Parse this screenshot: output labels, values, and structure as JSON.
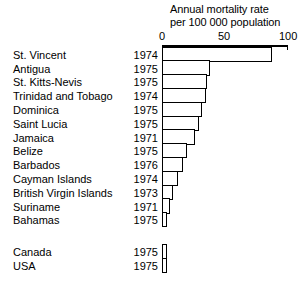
{
  "chart_data": {
    "type": "bar",
    "orientation": "horizontal",
    "title_line1": "Annual mortality rate",
    "title_line2": "per 100 000 population",
    "xlabel": "",
    "ylabel": "",
    "xlim": [
      0,
      100
    ],
    "xticks": [
      0,
      50,
      100
    ],
    "xticklabels": [
      "0",
      "50",
      "100"
    ],
    "grid": false,
    "legend": false,
    "categories": [
      "St. Vincent",
      "Antigua",
      "St. Kitts-Nevis",
      "Trinidad and Tobago",
      "Dominica",
      "Saint Lucia",
      "Jamaica",
      "Belize",
      "Barbados",
      "Cayman Islands",
      "British Virgin Islands",
      "Suriname",
      "Bahamas",
      "Canada",
      "USA"
    ],
    "years": [
      "1974",
      "1975",
      "1975",
      "1974",
      "1975",
      "1975",
      "1971",
      "1975",
      "1976",
      "1974",
      "1973",
      "1971",
      "1975",
      "1975",
      "1975"
    ],
    "values": [
      87,
      38,
      36,
      35,
      32,
      29,
      26,
      20,
      17,
      13,
      9,
      6,
      4,
      4,
      4
    ],
    "groups": [
      {
        "name": "Caribbean and South America",
        "categories": [
          "St. Vincent",
          "Antigua",
          "St. Kitts-Nevis",
          "Trinidad and Tobago",
          "Dominica",
          "Saint Lucia",
          "Jamaica",
          "Belize",
          "Barbados",
          "Cayman Islands",
          "British Virgin Islands",
          "Suriname",
          "Bahamas"
        ],
        "values": [
          87,
          38,
          36,
          35,
          32,
          29,
          26,
          20,
          17,
          13,
          9,
          6,
          4
        ]
      },
      {
        "name": "North America",
        "categories": [
          "Canada",
          "USA"
        ],
        "values": [
          4,
          4
        ]
      }
    ]
  },
  "rows": [
    {
      "label": "St. Vincent",
      "year": "1974",
      "value": 87
    },
    {
      "label": "Antigua",
      "year": "1975",
      "value": 38
    },
    {
      "label": "St. Kitts-Nevis",
      "year": "1975",
      "value": 36
    },
    {
      "label": "Trinidad and Tobago",
      "year": "1974",
      "value": 35
    },
    {
      "label": "Dominica",
      "year": "1975",
      "value": 32
    },
    {
      "label": "Saint Lucia",
      "year": "1975",
      "value": 29
    },
    {
      "label": "Jamaica",
      "year": "1971",
      "value": 26
    },
    {
      "label": "Belize",
      "year": "1975",
      "value": 20
    },
    {
      "label": "Barbados",
      "year": "1976",
      "value": 17
    },
    {
      "label": "Cayman Islands",
      "year": "1974",
      "value": 13
    },
    {
      "label": "British Virgin Islands",
      "year": "1973",
      "value": 9
    },
    {
      "label": "Suriname",
      "year": "1971",
      "value": 6
    },
    {
      "label": "Bahamas",
      "year": "1975",
      "value": 4
    }
  ],
  "rows_secondary": [
    {
      "label": "Canada",
      "year": "1975",
      "value": 4
    },
    {
      "label": "USA",
      "year": "1975",
      "value": 4
    }
  ],
  "colors": {
    "ink": "#000000",
    "paper": "#ffffff",
    "bar_fill": "#ffffff",
    "bar_stroke": "#000000"
  }
}
